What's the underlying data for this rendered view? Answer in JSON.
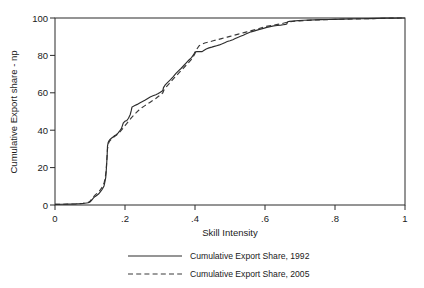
{
  "chart_data": {
    "type": "line",
    "title": "",
    "xlabel": "Skill Intensity",
    "ylabel": "Cumulative Export share - np",
    "xlim": [
      0,
      1
    ],
    "ylim": [
      0,
      100
    ],
    "xticks": [
      "0",
      ".2",
      ".4",
      ".6",
      ".8",
      "1"
    ],
    "xtick_values": [
      0,
      0.2,
      0.4,
      0.6,
      0.8,
      1
    ],
    "yticks": [
      "0",
      "20",
      "40",
      "60",
      "80",
      "100"
    ],
    "ytick_values": [
      0,
      20,
      40,
      60,
      80,
      100
    ],
    "grid": false,
    "legend_position": "below-center",
    "frame": "box",
    "series": [
      {
        "name": "Cumulative Export Share, 1992",
        "style": "solid",
        "color": "#2d2d2d",
        "x": [
          0.0,
          0.02,
          0.04,
          0.06,
          0.08,
          0.095,
          0.1,
          0.105,
          0.11,
          0.115,
          0.12,
          0.125,
          0.13,
          0.135,
          0.14,
          0.143,
          0.145,
          0.147,
          0.149,
          0.15,
          0.152,
          0.155,
          0.158,
          0.162,
          0.166,
          0.17,
          0.175,
          0.18,
          0.185,
          0.19,
          0.195,
          0.2,
          0.205,
          0.21,
          0.215,
          0.218,
          0.22,
          0.228,
          0.235,
          0.242,
          0.25,
          0.258,
          0.265,
          0.272,
          0.28,
          0.288,
          0.295,
          0.3,
          0.305,
          0.308,
          0.31,
          0.315,
          0.322,
          0.33,
          0.338,
          0.345,
          0.352,
          0.36,
          0.368,
          0.375,
          0.382,
          0.39,
          0.396,
          0.4,
          0.405,
          0.412,
          0.42,
          0.425,
          0.432,
          0.44,
          0.448,
          0.455,
          0.462,
          0.47,
          0.478,
          0.485,
          0.492,
          0.5,
          0.508,
          0.515,
          0.522,
          0.53,
          0.538,
          0.545,
          0.552,
          0.56,
          0.568,
          0.575,
          0.582,
          0.59,
          0.598,
          0.605,
          0.615,
          0.625,
          0.635,
          0.645,
          0.652,
          0.658,
          0.662,
          0.665,
          0.67,
          0.68,
          0.695,
          0.71,
          0.725,
          0.74,
          0.76,
          0.78,
          0.8,
          0.82,
          0.845,
          0.87,
          0.895,
          0.92,
          0.945,
          0.97,
          0.985,
          1.0
        ],
        "y": [
          0.3,
          0.4,
          0.5,
          0.6,
          0.8,
          1.2,
          1.6,
          2.6,
          3.8,
          4.6,
          5.2,
          6.0,
          7.2,
          8.4,
          10.2,
          12.8,
          14.8,
          20.0,
          26.5,
          31.5,
          33.5,
          34.6,
          35.2,
          35.8,
          36.4,
          37.0,
          37.6,
          38.4,
          39.6,
          41.0,
          43.8,
          44.8,
          45.2,
          46.4,
          48.4,
          50.6,
          52.4,
          53.2,
          53.8,
          54.6,
          55.4,
          56.2,
          57.0,
          57.8,
          58.4,
          59.0,
          59.6,
          60.2,
          60.8,
          61.2,
          62.8,
          64.2,
          65.6,
          67.0,
          68.6,
          70.2,
          71.6,
          73.0,
          74.6,
          76.0,
          77.4,
          78.8,
          80.4,
          81.8,
          82.0,
          82.0,
          82.0,
          82.6,
          83.4,
          84.0,
          84.4,
          84.8,
          85.2,
          85.6,
          86.2,
          86.8,
          87.4,
          87.8,
          88.4,
          89.0,
          89.6,
          90.2,
          90.8,
          91.4,
          92.0,
          92.6,
          93.0,
          93.4,
          93.8,
          94.2,
          94.6,
          95.0,
          95.4,
          95.8,
          96.0,
          96.2,
          96.4,
          96.6,
          96.8,
          98.0,
          98.2,
          98.4,
          98.6,
          98.8,
          98.9,
          99.0,
          99.1,
          99.2,
          99.3,
          99.4,
          99.5,
          99.6,
          99.7,
          99.8,
          99.9,
          99.95,
          99.98,
          100.0
        ]
      },
      {
        "name": "Cumulative Export Share, 2005",
        "style": "dashed",
        "color": "#3a3a3a",
        "x": [
          0.0,
          0.02,
          0.04,
          0.06,
          0.08,
          0.095,
          0.1,
          0.105,
          0.11,
          0.115,
          0.12,
          0.125,
          0.13,
          0.135,
          0.14,
          0.143,
          0.146,
          0.148,
          0.15,
          0.153,
          0.156,
          0.16,
          0.165,
          0.17,
          0.176,
          0.182,
          0.188,
          0.194,
          0.2,
          0.206,
          0.212,
          0.218,
          0.225,
          0.232,
          0.24,
          0.248,
          0.256,
          0.264,
          0.272,
          0.28,
          0.288,
          0.295,
          0.302,
          0.308,
          0.312,
          0.318,
          0.325,
          0.332,
          0.34,
          0.348,
          0.356,
          0.364,
          0.372,
          0.38,
          0.388,
          0.394,
          0.4,
          0.406,
          0.412,
          0.42,
          0.428,
          0.436,
          0.444,
          0.452,
          0.46,
          0.468,
          0.476,
          0.484,
          0.492,
          0.5,
          0.508,
          0.516,
          0.524,
          0.532,
          0.54,
          0.548,
          0.556,
          0.564,
          0.572,
          0.58,
          0.59,
          0.6,
          0.612,
          0.624,
          0.636,
          0.648,
          0.66,
          0.672,
          0.686,
          0.7,
          0.72,
          0.74,
          0.76,
          0.785,
          0.81,
          0.835,
          0.86,
          0.885,
          0.91,
          0.935,
          0.96,
          0.98,
          1.0
        ],
        "y": [
          0.3,
          0.4,
          0.5,
          0.6,
          0.9,
          1.4,
          2.0,
          3.2,
          4.4,
          5.4,
          6.2,
          7.0,
          8.2,
          9.6,
          11.6,
          14.0,
          18.0,
          24.0,
          30.0,
          33.0,
          34.2,
          35.0,
          35.8,
          36.6,
          37.4,
          38.4,
          39.6,
          41.0,
          42.4,
          43.8,
          45.2,
          46.6,
          48.0,
          49.4,
          50.8,
          52.0,
          53.0,
          54.0,
          55.0,
          56.0,
          57.0,
          58.0,
          59.0,
          60.0,
          61.8,
          63.2,
          64.6,
          66.2,
          67.8,
          69.4,
          71.0,
          72.6,
          74.2,
          75.8,
          77.4,
          79.0,
          81.0,
          83.6,
          85.2,
          86.0,
          86.6,
          87.0,
          87.4,
          87.8,
          88.2,
          88.6,
          89.0,
          89.4,
          89.8,
          90.2,
          90.6,
          91.0,
          91.4,
          91.8,
          92.2,
          92.6,
          93.0,
          93.4,
          93.8,
          94.2,
          94.8,
          95.4,
          95.8,
          96.2,
          96.6,
          97.0,
          97.6,
          98.0,
          98.3,
          98.5,
          98.7,
          98.9,
          99.0,
          99.2,
          99.3,
          99.4,
          99.5,
          99.6,
          99.7,
          99.8,
          99.9,
          99.95,
          100.0
        ]
      }
    ]
  },
  "legend": {
    "entries": [
      {
        "label": "Cumulative Export Share, 1992",
        "style": "solid"
      },
      {
        "label": "Cumulative Export Share, 2005",
        "style": "dashed"
      }
    ]
  }
}
